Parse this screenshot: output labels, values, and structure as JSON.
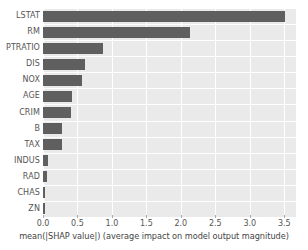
{
  "chart_data": {
    "type": "bar",
    "orientation": "horizontal",
    "title": "",
    "xlabel": "mean(|SHAP value|) (average impact on model output magnitude)",
    "ylabel": "",
    "categories": [
      "LSTAT",
      "RM",
      "PTRATIO",
      "DIS",
      "NOX",
      "AGE",
      "CRIM",
      "B",
      "TAX",
      "INDUS",
      "RAD",
      "CHAS",
      "ZN"
    ],
    "values": [
      3.51,
      2.13,
      0.87,
      0.61,
      0.57,
      0.42,
      0.41,
      0.28,
      0.27,
      0.075,
      0.06,
      0.025,
      0.015
    ],
    "xlim": [
      0.0,
      3.67
    ],
    "xticks": [
      0.0,
      0.5,
      1.0,
      1.5,
      2.0,
      2.5,
      3.0,
      3.5
    ],
    "xticklabels": [
      "0.0",
      "0.5",
      "1.0",
      "1.5",
      "2.0",
      "2.5",
      "3.0",
      "3.5"
    ],
    "grid": true,
    "legend": null,
    "bar_color": "#5f5f5f",
    "plot_background": "#eaeaea",
    "grid_color": "#ffffff",
    "tick_label_color": "#555555"
  }
}
